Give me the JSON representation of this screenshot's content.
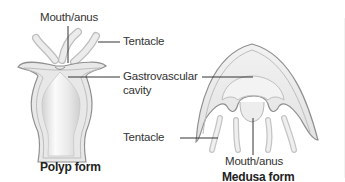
{
  "diagram": {
    "polyp": {
      "caption": "Polyp form",
      "labels": {
        "mouth": "Mouth/anus",
        "tentacle": "Tentacle",
        "cavity_line1": "Gastrovascular",
        "cavity_line2": "cavity"
      }
    },
    "medusa": {
      "caption": "Medusa form",
      "labels": {
        "tentacle": "Tentacle",
        "mouth": "Mouth/anus"
      }
    },
    "colors": {
      "outline": "#9a9a9a",
      "body_fill": "#e6e6e6",
      "inner_fill": "#f4f4f4",
      "leader_line": "#333333",
      "text": "#333333"
    }
  }
}
